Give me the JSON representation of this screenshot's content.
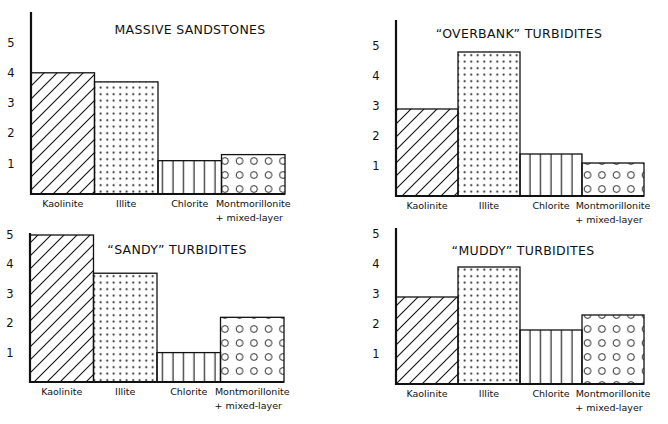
{
  "figure": {
    "panels_label": "Clay mineral abundance by facies"
  },
  "chart_data": [
    {
      "type": "bar",
      "title": "MASSIVE SANDSTONES",
      "categories": [
        "Kaolinite",
        "Illite",
        "Chlorite",
        "Montmorillonite + mixed-layer"
      ],
      "category_lines": [
        [
          "Kaolinite"
        ],
        [
          "Illite"
        ],
        [
          "Chlorite"
        ],
        [
          "Montmorillonite",
          "+ mixed-layer"
        ]
      ],
      "values": [
        4.0,
        3.7,
        1.1,
        1.3
      ],
      "patterns": [
        "diagonal-hatch",
        "dots",
        "vertical-lines",
        "circles"
      ],
      "yticks": [
        1,
        2,
        3,
        4,
        5
      ],
      "ylim": [
        0,
        5.5
      ],
      "xlabel": "",
      "ylabel": "",
      "grid": false,
      "legend": "none",
      "layout": {
        "axis_x": 31,
        "baseline_y": 194,
        "unit_px": 30.3,
        "bar_w": 63.5,
        "axis_top": 12,
        "title_x": 190,
        "title_y": 34
      }
    },
    {
      "type": "bar",
      "title": "“OVERBANK” TURBIDITES",
      "categories": [
        "Kaolinite",
        "Illite",
        "Chlorite",
        "Montmorillonite + mixed-layer"
      ],
      "category_lines": [
        [
          "Kaolinite"
        ],
        [
          "Illite"
        ],
        [
          "Chlorite"
        ],
        [
          "Montmorillonite",
          "+ mixed-layer"
        ]
      ],
      "values": [
        2.9,
        4.8,
        1.4,
        1.1
      ],
      "patterns": [
        "diagonal-hatch",
        "dots",
        "vertical-lines",
        "circles"
      ],
      "yticks": [
        1,
        2,
        3,
        4,
        5
      ],
      "ylim": [
        0,
        5.8
      ],
      "xlabel": "",
      "ylabel": "",
      "grid": false,
      "legend": "none",
      "layout": {
        "axis_x": 396,
        "baseline_y": 196,
        "unit_px": 30.0,
        "bar_w": 62,
        "axis_top": 20,
        "title_x": 519,
        "title_y": 38
      }
    },
    {
      "type": "bar",
      "title": "“SANDY” TURBIDITES",
      "categories": [
        "Kaolinite",
        "Illite",
        "Chlorite",
        "Montmorillonite + mixed-layer"
      ],
      "category_lines": [
        [
          "Kaolinite"
        ],
        [
          "Illite"
        ],
        [
          "Chlorite"
        ],
        [
          "Montmorillonite",
          "+ mixed-layer"
        ]
      ],
      "values": [
        5.0,
        3.7,
        1.0,
        2.2
      ],
      "patterns": [
        "diagonal-hatch",
        "dots",
        "vertical-lines",
        "circles"
      ],
      "yticks": [
        1,
        2,
        3,
        4,
        5
      ],
      "ylim": [
        0,
        5
      ],
      "xlabel": "",
      "ylabel": "",
      "grid": false,
      "legend": "none",
      "layout": {
        "axis_x": 30,
        "baseline_y": 382,
        "unit_px": 29.4,
        "bar_w": 63.5,
        "axis_top": 233,
        "title_x": 177,
        "title_y": 254
      }
    },
    {
      "type": "bar",
      "title": "“MUDDY” TURBIDITES",
      "categories": [
        "Kaolinite",
        "Illite",
        "Chlorite",
        "Montmorillonite + mixed-layer"
      ],
      "category_lines": [
        [
          "Kaolinite"
        ],
        [
          "Illite"
        ],
        [
          "Chlorite"
        ],
        [
          "Montmorillonite",
          "+ mixed-layer"
        ]
      ],
      "values": [
        2.9,
        3.9,
        1.8,
        2.3
      ],
      "patterns": [
        "diagonal-hatch",
        "dots",
        "vertical-lines",
        "circles"
      ],
      "yticks": [
        1,
        2,
        3,
        4,
        5
      ],
      "ylim": [
        0,
        5.2
      ],
      "xlabel": "",
      "ylabel": "",
      "grid": false,
      "legend": "none",
      "layout": {
        "axis_x": 396,
        "baseline_y": 384,
        "unit_px": 30.0,
        "bar_w": 62,
        "axis_top": 228,
        "title_x": 523,
        "title_y": 255
      }
    }
  ],
  "colors": {
    "ink": "#111111",
    "paper": "#ffffff"
  }
}
